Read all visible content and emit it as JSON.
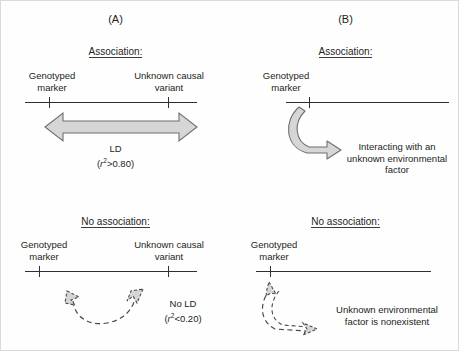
{
  "figure": {
    "panels": [
      {
        "id": "A",
        "label": "(A)",
        "sections": [
          {
            "id": "association",
            "heading": "Association:",
            "left_label_line1": "Genotyped",
            "left_label_line2": "marker",
            "right_label_line1": "Unknown causal",
            "right_label_line2": "variant",
            "annotation_line1": "LD",
            "annotation_line2_prefix": "(",
            "annotation_line2_symbol": "r",
            "annotation_line2_exponent": "2",
            "annotation_line2_suffix": ">0.80)",
            "arrow_type": "double-headed-solid-gray"
          },
          {
            "id": "no-association",
            "heading": "No association:",
            "left_label_line1": "Genotyped",
            "left_label_line2": "marker",
            "right_label_line1": "Unknown causal",
            "right_label_line2": "variant",
            "annotation_line1": "No LD",
            "annotation_line2_prefix": "(",
            "annotation_line2_symbol": "r",
            "annotation_line2_exponent": "2",
            "annotation_line2_suffix": "<0.20)",
            "arrow_type": "double-headed-dashed-curve"
          }
        ]
      },
      {
        "id": "B",
        "label": "(B)",
        "sections": [
          {
            "id": "association",
            "heading": "Association:",
            "left_label_line1": "Genotyped",
            "left_label_line2": "marker",
            "annotation_line1": "Interacting with an",
            "annotation_line2": "unknown environmental",
            "annotation_line3": "factor",
            "arrow_type": "curved-solid-gray"
          },
          {
            "id": "no-association",
            "heading": "No association:",
            "left_label_line1": "Genotyped",
            "left_label_line2": "marker",
            "annotation_line1": "Unknown environmental",
            "annotation_line2": "factor is nonexistent",
            "arrow_type": "curved-dashed-double"
          }
        ]
      }
    ],
    "colors": {
      "line": "#2f2f2f",
      "arrow_fill": "#d6d6d6",
      "arrow_stroke": "#6f6f6f",
      "text": "#231f20",
      "background": "#ffffff"
    }
  }
}
